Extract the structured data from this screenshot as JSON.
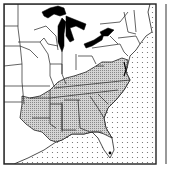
{
  "map": {
    "region": "Eastern United States",
    "legend": {
      "shaded_label": "",
      "shaded_color": "#b8b8b8",
      "water_pattern": "dotted",
      "marker_color": "#000000"
    },
    "shaded_states": [
      "Texas (east)",
      "Oklahoma (east)",
      "Arkansas",
      "Louisiana",
      "Mississippi",
      "Alabama",
      "Georgia",
      "South Carolina",
      "North Carolina",
      "Tennessee",
      "Kentucky",
      "Virginia",
      "West Virginia (part)",
      "Florida (north)",
      "Missouri (south)",
      "Illinois (south)",
      "Indiana (south)",
      "Ohio (south)",
      "Maryland",
      "Delaware"
    ],
    "markers": [
      {
        "label": "",
        "location": "south Florida"
      }
    ]
  }
}
